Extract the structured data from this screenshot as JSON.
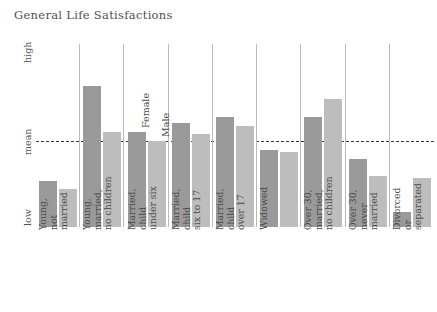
{
  "chart": {
    "title": "General Life Satisfactions",
    "y_axis": {
      "ticks": [
        {
          "label": "high",
          "pos": 0.97
        },
        {
          "label": "mean",
          "pos": 0.47
        },
        {
          "label": "low",
          "pos": 0.08
        }
      ]
    },
    "series_labels": {
      "female": "Female",
      "male": "Male"
    },
    "mean_line_label": "mean"
  },
  "chart_data": {
    "type": "bar",
    "title": "General Life Satisfactions",
    "xlabel": "",
    "ylabel": "",
    "ylim": [
      0,
      1
    ],
    "grid": false,
    "legend_position": "inline-above-bars",
    "mean_reference": 0.47,
    "axis_tick_labels": [
      "low",
      "mean",
      "high"
    ],
    "categories": [
      "Young, not married",
      "Young, married, no children",
      "Married, child under six",
      "Married, child six to 17",
      "Married, child over 17",
      "Widowed",
      "Over 30, married, no children",
      "Over 30, never married",
      "Divorced or separated"
    ],
    "series": [
      {
        "name": "Female",
        "values": [
          0.25,
          0.77,
          0.52,
          0.57,
          0.6,
          0.42,
          0.6,
          0.37,
          0.08
        ]
      },
      {
        "name": "Male",
        "values": [
          0.21,
          0.52,
          0.47,
          0.51,
          0.55,
          0.41,
          0.7,
          0.28,
          0.27
        ]
      }
    ],
    "group_separators_after": [
      0,
      1,
      2,
      3,
      4,
      5,
      6,
      7
    ]
  },
  "categories_wrapped": [
    [
      "Young,",
      "not",
      "married"
    ],
    [
      "Young,",
      "married,",
      "no children"
    ],
    [
      "Married,",
      "child",
      "under six"
    ],
    [
      "Married,",
      "child",
      "six to 17"
    ],
    [
      "Married,",
      "child",
      "over 17"
    ],
    [
      "Widowed"
    ],
    [
      "Over 30,",
      "married,",
      "no children"
    ],
    [
      "Over 30,",
      "never",
      "married"
    ],
    [
      "Divorced",
      "or",
      "separated"
    ]
  ],
  "colors": {
    "female_bar": "#9a9a9a",
    "male_bar": "#bdbdbd",
    "separator": "#b9b9b9",
    "mean_line": "#3b3b3b",
    "text": "#4a4a4a",
    "background": "#ffffff"
  }
}
